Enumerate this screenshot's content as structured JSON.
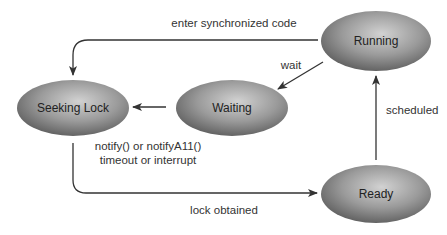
{
  "diagram": {
    "type": "state-diagram",
    "nodes": [
      {
        "id": "seeking_lock",
        "label": "Seeking Lock"
      },
      {
        "id": "waiting",
        "label": "Waiting"
      },
      {
        "id": "running",
        "label": "Running"
      },
      {
        "id": "ready",
        "label": "Ready"
      }
    ],
    "edges": [
      {
        "from": "running",
        "to": "seeking_lock",
        "label": "enter synchronized code"
      },
      {
        "from": "running",
        "to": "waiting",
        "label": "wait"
      },
      {
        "from": "waiting",
        "to": "seeking_lock",
        "label_line1": "notify() or notifyA11()",
        "label_line2": "timeout or interrupt"
      },
      {
        "from": "seeking_lock",
        "to": "ready",
        "label": "lock obtained"
      },
      {
        "from": "ready",
        "to": "running",
        "label": "scheduled"
      }
    ],
    "colors": {
      "node_fill_dark": "#6e6e6e",
      "node_fill_light": "#c8c8c8",
      "arrow": "#333333"
    }
  }
}
